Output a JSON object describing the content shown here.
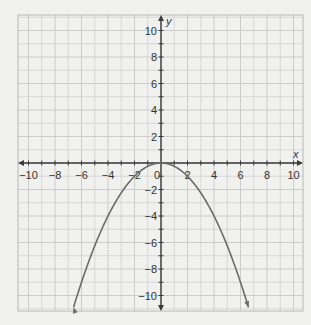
{
  "chart_data": {
    "type": "line",
    "title": "",
    "xlabel": "x",
    "ylabel": "y",
    "xlim": [
      -10.7,
      10.7
    ],
    "ylim": [
      -11,
      11
    ],
    "grid": true,
    "grid_step": 1,
    "x_ticks": [
      -10,
      -8,
      -6,
      -4,
      -2,
      0,
      2,
      4,
      6,
      8,
      10
    ],
    "y_ticks": [
      -10,
      -8,
      -6,
      -4,
      -2,
      2,
      4,
      6,
      8,
      10
    ],
    "x_tick_labels": [
      "−10",
      "−8",
      "−6",
      "−4",
      "−2",
      "0",
      "2",
      "4",
      "6",
      "8",
      "10"
    ],
    "y_tick_labels": [
      "−10",
      "−8",
      "−6",
      "−4",
      "−2",
      "2",
      "4",
      "6",
      "8",
      "10"
    ],
    "series": [
      {
        "name": "y = -x²/4",
        "function": "-0.25*x^2",
        "x": [
          -6.6,
          -6,
          -4,
          -2,
          0,
          2,
          4,
          6,
          6.6
        ],
        "y": [
          -10.9,
          -9,
          -4,
          -1,
          0,
          -1,
          -4,
          -9,
          -10.9
        ],
        "color": "#6b6b6b",
        "arrows_at_ends": true
      }
    ],
    "legend": null
  },
  "colors": {
    "background": "#f1f1f0",
    "grid": "#c8c8c8",
    "axis": "#3a3a3a",
    "curve": "#6b6b6b"
  }
}
